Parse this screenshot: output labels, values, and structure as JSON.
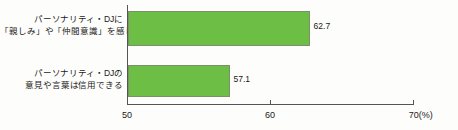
{
  "chart_data": {
    "type": "bar",
    "orientation": "horizontal",
    "title": "",
    "subtitle": "",
    "xlabel": "",
    "ylabel": "",
    "unit_label": "(%)",
    "xlim": [
      50,
      70
    ],
    "grid": false,
    "legend": null,
    "categories": [
      "パーソナリティ・DJに「親しみ」や「仲間意識」を感じる",
      "パーソナリティ・DJの意見や言葉は信用できる"
    ],
    "category_lines": [
      [
        "パーソナリティ・DJに",
        "「親しみ」や「仲間意識」を感じる"
      ],
      [
        "パーソナリティ・DJの",
        "意見や言葉は信用できる"
      ]
    ],
    "values": [
      62.7,
      57.1
    ],
    "value_labels": [
      "62.7",
      "57.1"
    ],
    "ticks": [
      50,
      60,
      70
    ],
    "tick_labels": [
      "50",
      "60",
      "70(%)"
    ],
    "colors": {
      "bar_fill": "#6cbe45",
      "bar_border": "#7a8f6a",
      "axis": "#555555",
      "text": "#1a1a1a",
      "background": "#fdfdfb"
    }
  }
}
